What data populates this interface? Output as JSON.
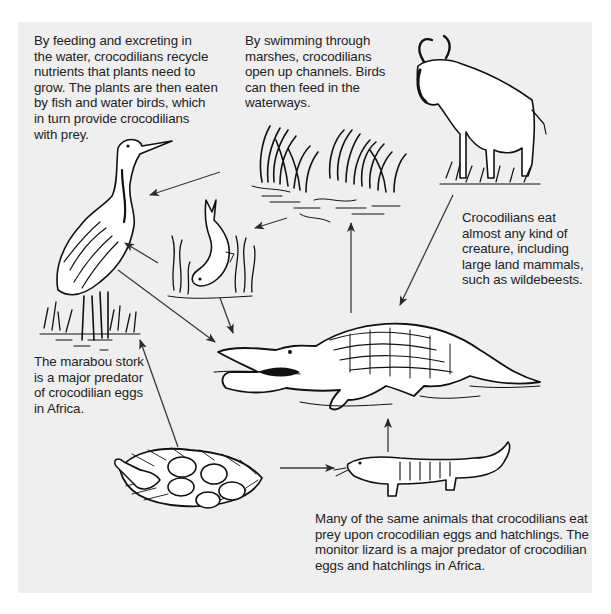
{
  "diagram": {
    "type": "food-web",
    "background_color": "#efefef",
    "nodes": [
      {
        "id": "stork",
        "label": "marabou stork",
        "icon": "stork-illustration"
      },
      {
        "id": "marsh",
        "label": "marsh reeds",
        "icon": "reeds-illustration"
      },
      {
        "id": "fish",
        "label": "fish",
        "icon": "fish-illustration"
      },
      {
        "id": "wildebeest",
        "label": "wildebeest",
        "icon": "wildebeest-illustration"
      },
      {
        "id": "crocodile",
        "label": "crocodile",
        "icon": "crocodile-illustration"
      },
      {
        "id": "nest",
        "label": "crocodile eggs and hatchling",
        "icon": "nest-illustration"
      },
      {
        "id": "lizard",
        "label": "monitor lizard",
        "icon": "lizard-illustration"
      }
    ],
    "edges": [
      {
        "from": "marsh",
        "to": "stork"
      },
      {
        "from": "marsh",
        "to": "fish"
      },
      {
        "from": "fish",
        "to": "stork"
      },
      {
        "from": "stork",
        "to": "crocodile"
      },
      {
        "from": "fish",
        "to": "crocodile"
      },
      {
        "from": "crocodile",
        "to": "marsh"
      },
      {
        "from": "wildebeest",
        "to": "crocodile"
      },
      {
        "from": "nest",
        "to": "stork"
      },
      {
        "from": "nest",
        "to": "lizard"
      },
      {
        "from": "lizard",
        "to": "crocodile"
      }
    ]
  },
  "captions": {
    "nutrients": [
      "By feeding and excreting in",
      "the water, crocodilians recycle",
      "nutrients that plants need to",
      "grow. The plants are then eaten",
      "by fish and water birds, which",
      "in turn provide crocodilians",
      "with prey."
    ],
    "channels": [
      "By swimming through",
      "marshes, crocodilians",
      "open up channels. Birds",
      "can then feed in the",
      "waterways."
    ],
    "diet": [
      "Crocodilians eat",
      "almost any kind of",
      "creature, including",
      "large land mammals,",
      "such as wildebeests."
    ],
    "stork": [
      "The marabou stork",
      "is a major predator",
      "of crocodilian eggs",
      "in Africa."
    ],
    "lizard": [
      "Many of the same animals that crocodilians eat",
      "prey upon crocodilian eggs and hatchlings. The",
      "monitor lizard is a major predator of crocodilian",
      "eggs and hatchlings in Africa."
    ]
  }
}
